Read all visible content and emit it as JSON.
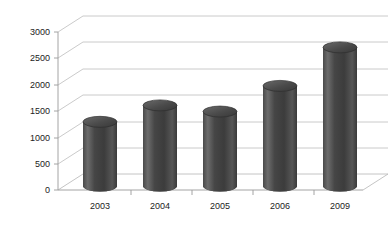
{
  "chart_data": {
    "type": "bar",
    "title": "",
    "subtitle": "",
    "xlabel": "",
    "ylabel": "",
    "categories": [
      "2003",
      "2004",
      "2005",
      "2006",
      "2009"
    ],
    "values": [
      1250,
      1570,
      1450,
      1950,
      2700
    ],
    "series": [
      {
        "name": "",
        "values": [
          1250,
          1570,
          1450,
          1950,
          2700
        ]
      }
    ],
    "ylim": [
      0,
      3000
    ],
    "yticks": [
      0,
      500,
      1000,
      1500,
      2000,
      2500,
      3000
    ],
    "ytick_labels": [
      "0",
      "500",
      "1000",
      "1500",
      "2000",
      "2500",
      "3000"
    ],
    "grid": true,
    "legend": false,
    "legend_position": "none",
    "style_3d": true,
    "bar_shape": "cylinder",
    "colors": {
      "bar_dark": "#3a3a3a",
      "bar_mid": "#4d4d4d",
      "bar_light": "#6f6f6f",
      "bar_edge": "#2b2b2b",
      "bar_top": "#555555",
      "gridline": "#bdbdbd",
      "axis": "#9a9a9a",
      "text": "#222222",
      "background": "#ffffff"
    }
  }
}
